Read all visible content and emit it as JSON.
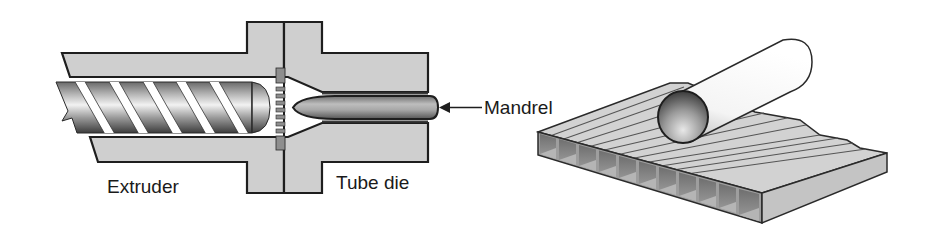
{
  "figure": {
    "left_panel": {
      "title": "Extrusion of tube through a die",
      "labels": {
        "extruder": "Extruder",
        "tube_die": "Tube die",
        "mandrel": "Mandrel"
      },
      "components": [
        "barrel",
        "screw",
        "breaker-plate",
        "die-body",
        "mandrel",
        "arrow"
      ]
    },
    "right_panel": {
      "title": "Twin-wall extruded sheet with tube roller",
      "components": [
        "cylindrical-roller",
        "twin-wall-sheet",
        "rectangular-cells"
      ],
      "cell_count": 11
    },
    "colors": {
      "background": "#ffffff",
      "body_fill": "#cfcfcf",
      "outline": "#1e1e1e",
      "breaker_fill": "#8e8e8e",
      "sheet_top": "#d2d2d2",
      "sheet_front": "#bdbdbd",
      "cell_dark": "#7a7a7a"
    }
  }
}
